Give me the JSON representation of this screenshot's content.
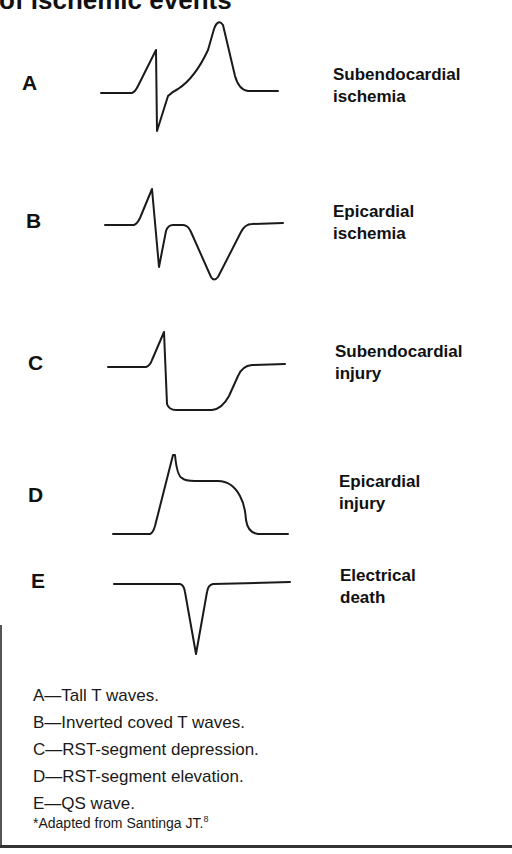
{
  "title": "of ischemic events",
  "rows": [
    {
      "letter": "A",
      "label_line1": "Subendocardial",
      "label_line2": "ischemia"
    },
    {
      "letter": "B",
      "label_line1": "Epicardial",
      "label_line2": "ischemia"
    },
    {
      "letter": "C",
      "label_line1": "Subendocardial",
      "label_line2": "injury"
    },
    {
      "letter": "D",
      "label_line1": "Epicardial",
      "label_line2": "injury"
    },
    {
      "letter": "E",
      "label_line1": "Electrical",
      "label_line2": "death"
    }
  ],
  "legend": [
    "A—Tall T waves.",
    "B—Inverted coved T waves.",
    "C—RST-segment depression.",
    "D—RST-segment elevation.",
    "E—QS wave."
  ],
  "footnote": {
    "text": "*Adapted from Santinga JT.",
    "ref": "8"
  },
  "waveforms": {
    "A": "Tall T wave after QRS",
    "B": "Inverted coved T wave",
    "C": "RST-segment depression",
    "D": "RST-segment elevation",
    "E": "QS wave"
  },
  "colors": {
    "ink": "#111111",
    "background": "#ffffff"
  }
}
